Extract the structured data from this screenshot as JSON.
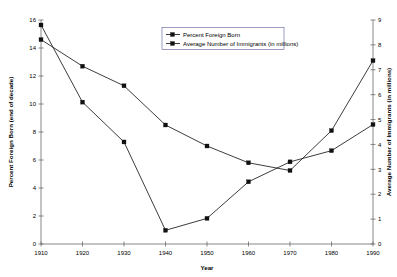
{
  "chart_data": {
    "type": "line",
    "title": "",
    "xlabel": "Year",
    "ylabel": "Percent Foreign Born (end of decade)",
    "ylabel_right": "Average Number of Immigrants (in millions)",
    "grid": false,
    "legend_position": "top-center",
    "x": [
      1910,
      1920,
      1930,
      1940,
      1950,
      1960,
      1970,
      1980,
      1990
    ],
    "categories": [
      "1910",
      "1920",
      "1930",
      "1940",
      "1950",
      "1960",
      "1970",
      "1980",
      "1990"
    ],
    "xlim": [
      1910,
      1990
    ],
    "ylim": [
      0,
      16
    ],
    "ylim_right": [
      0,
      9
    ],
    "yticks": [
      0,
      2,
      4,
      6,
      8,
      10,
      12,
      14,
      16
    ],
    "yticks_right": [
      0,
      1,
      2,
      3,
      4,
      5,
      6,
      7,
      8,
      9
    ],
    "xticks": [
      1910,
      1920,
      1930,
      1940,
      1950,
      1960,
      1970,
      1980,
      1990
    ],
    "series": [
      {
        "name": "Percent Foreign Born",
        "axis": "left",
        "marker": "square",
        "color": "#111111",
        "values": [
          14.6,
          12.7,
          11.3,
          8.5,
          7.0,
          5.8,
          5.25,
          8.1,
          13.1
        ]
      },
      {
        "name": "Average Number of Immigrants (in millions)",
        "axis": "right",
        "marker": "square",
        "color": "#111111",
        "values": [
          8.8,
          5.7,
          4.1,
          0.55,
          1.03,
          2.5,
          3.3,
          3.75,
          4.8
        ]
      }
    ],
    "legend": [
      "Percent Foreign Born",
      "Average Number of Immigrants (in millions)"
    ]
  }
}
